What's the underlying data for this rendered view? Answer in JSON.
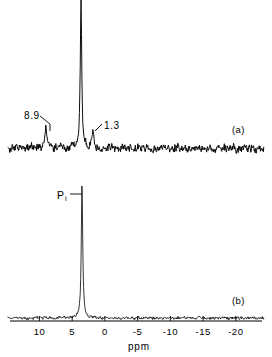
{
  "figure": {
    "type": "nmr-spectrum-figure",
    "width": 272,
    "height": 357,
    "background": "#ffffff",
    "trace_color": "#000000"
  },
  "axis": {
    "title": "ppm",
    "tick_labels": [
      "10",
      "5",
      "0",
      "-5",
      "-10",
      "-15",
      "-20"
    ],
    "tick_values": [
      10,
      5,
      0,
      -5,
      -10,
      -15,
      -20
    ],
    "range": [
      14.5,
      -24.0
    ],
    "direction": "decreasing-left-to-right",
    "line_x_start": 10,
    "line_x_end": 262,
    "line_y": 321,
    "tick_length": 5,
    "tick_direction": "up"
  },
  "panels": [
    {
      "id": "a",
      "tag": "(a)",
      "tag_x": 232,
      "tag_y": 125,
      "baseline_y": 148,
      "noise_amplitude": 5.0,
      "peaks": [
        {
          "label": "8.9",
          "ppm": 8.9,
          "x": 46,
          "height": 22,
          "width": 1.1,
          "label_x": 24,
          "label_y": 111,
          "leader": [
            [
              40,
              116
            ],
            [
              50,
              124
            ],
            [
              50,
              131
            ]
          ]
        },
        {
          "label": "",
          "ppm": 2.7,
          "x": 81,
          "height": 148,
          "width": 1.0,
          "label_x": 0,
          "label_y": 0,
          "leader": []
        },
        {
          "label": "1.3",
          "ppm": 1.3,
          "x": 93,
          "height": 17,
          "width": 1.1,
          "label_x": 104,
          "label_y": 121,
          "leader": [
            [
              102,
              124
            ],
            [
              95,
              131
            ]
          ]
        }
      ]
    },
    {
      "id": "b",
      "tag": "(b)",
      "tag_x": 232,
      "tag_y": 296,
      "baseline_y": 318,
      "noise_amplitude": 1.6,
      "peaks": [
        {
          "label": "P",
          "sub": "i",
          "ppm": 2.7,
          "x": 82,
          "height": 133,
          "width": 1.0,
          "label_x": 57,
          "label_y": 190,
          "leader": [
            [
              70,
              194
            ],
            [
              82,
              194
            ]
          ]
        }
      ]
    }
  ],
  "annotations": {
    "peak_8_9": "8.9",
    "peak_1_3": "1.3",
    "pi_main": "P",
    "pi_sub": "i",
    "panel_a_tag": "(a)",
    "panel_b_tag": "(b)"
  },
  "chart_data": {
    "type": "line",
    "title": "",
    "xlabel": "ppm",
    "ylabel": "",
    "xlim": [
      14.5,
      -24.0
    ],
    "grid": false,
    "legend": "none",
    "series": [
      {
        "name": "(a)",
        "panel": "a",
        "annotated_peaks": [
          {
            "shift_ppm": 8.9,
            "label": "8.9",
            "relative_intensity": 0.15
          },
          {
            "shift_ppm": 2.7,
            "label": "",
            "relative_intensity": 1.0
          },
          {
            "shift_ppm": 1.3,
            "label": "1.3",
            "relative_intensity": 0.11
          }
        ],
        "noise_level": "high"
      },
      {
        "name": "(b)",
        "panel": "b",
        "annotated_peaks": [
          {
            "shift_ppm": 2.7,
            "label": "Pi",
            "relative_intensity": 1.0
          }
        ],
        "noise_level": "low"
      }
    ]
  }
}
